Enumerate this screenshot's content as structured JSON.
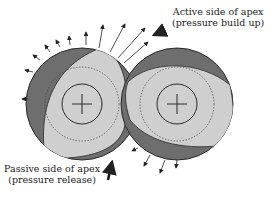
{
  "diagram": {
    "labels": {
      "active_line1": "Active side of apex",
      "active_line2": "(pressure build up)",
      "passive_line1": "Passive side of apex",
      "passive_line2": "(pressure release)"
    },
    "colors": {
      "dark_region": "#6e6e6e",
      "light_region": "#cfcfcf",
      "outline": "#2a2a2a",
      "background": "#ffffff"
    },
    "elements": {
      "left_rotor": "Left rotor with center cross",
      "right_rotor": "Right rotor with center cross"
    }
  }
}
